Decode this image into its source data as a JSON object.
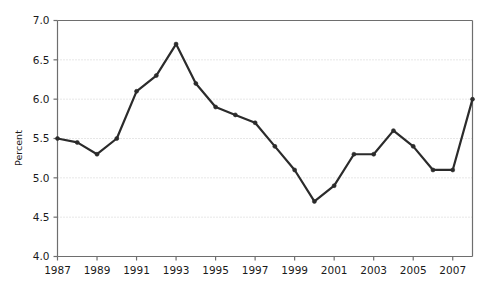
{
  "chart_data": {
    "type": "line",
    "title": "",
    "subtitle": "",
    "xlabel": "",
    "ylabel": "Percent",
    "xlim": [
      1987,
      2008
    ],
    "ylim": [
      4.0,
      7.0
    ],
    "grid": true,
    "legend": null,
    "legend_position": "none",
    "x": [
      1987,
      1988,
      1989,
      1990,
      1991,
      1992,
      1993,
      1994,
      1995,
      1996,
      1997,
      1998,
      1999,
      2000,
      2001,
      2002,
      2003,
      2004,
      2005,
      2006,
      2007,
      2008
    ],
    "values": [
      5.5,
      5.45,
      5.3,
      5.5,
      6.1,
      6.3,
      6.7,
      6.2,
      5.9,
      5.8,
      5.7,
      5.4,
      5.1,
      4.7,
      4.9,
      5.3,
      5.3,
      5.6,
      5.4,
      5.1,
      5.1,
      6.0
    ],
    "series": [
      {
        "name": "Percent",
        "color": "#2b2b2b",
        "marker": "circle",
        "values": [
          5.5,
          5.45,
          5.3,
          5.5,
          6.1,
          6.3,
          6.7,
          6.2,
          5.9,
          5.8,
          5.7,
          5.4,
          5.1,
          4.7,
          4.9,
          5.3,
          5.3,
          5.6,
          5.4,
          5.1,
          5.1,
          6.0
        ]
      }
    ],
    "yticks": [
      4.0,
      4.5,
      5.0,
      5.5,
      6.0,
      6.5,
      7.0
    ],
    "ytick_labels": [
      "4.0",
      "4.5",
      "5.0",
      "5.5",
      "6.0",
      "6.5",
      "7.0"
    ],
    "xticks": [
      1987,
      1989,
      1991,
      1993,
      1995,
      1997,
      1999,
      2001,
      2003,
      2005,
      2007
    ],
    "xtick_labels": [
      "1987",
      "1989",
      "1991",
      "1993",
      "1995",
      "1997",
      "1999",
      "2001",
      "2003",
      "2005",
      "2007"
    ],
    "colors": {
      "line": "#2b2b2b",
      "grid": "#cfcfcf",
      "axis": "#6e6e6e",
      "background": "#ffffff",
      "text": "#1a1a1a"
    }
  }
}
